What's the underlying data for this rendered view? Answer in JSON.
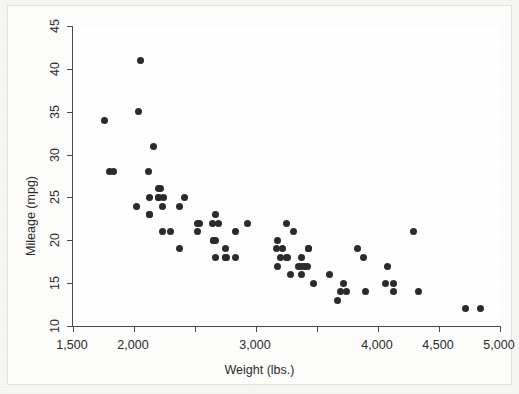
{
  "figure": {
    "background_color": "#f6f6f4",
    "paper_color": "#fdfdfc",
    "axis_color": "#4a4a4a",
    "marker_color": "#2b2b2b"
  },
  "chart_data": {
    "type": "scatter",
    "title": "",
    "xlabel": "Weight (lbs.)",
    "ylabel": "Mileage (mpg)",
    "xlim": [
      1500,
      5000
    ],
    "ylim": [
      10,
      45
    ],
    "xticks": [
      1500,
      2000,
      2500,
      3000,
      3500,
      4000,
      4500,
      5000
    ],
    "xtick_labels": [
      "1,500",
      "2,000",
      "",
      "3,000",
      "",
      "4,000",
      "4,500",
      "5,000"
    ],
    "yticks": [
      10,
      15,
      20,
      25,
      30,
      35,
      40,
      45
    ],
    "ytick_labels": [
      "10",
      "15",
      "20",
      "25",
      "30",
      "35",
      "40",
      "45"
    ],
    "grid": false,
    "legend": false,
    "marker": "filled-circle",
    "marker_size_px": 7,
    "n_points": 74,
    "series": [
      {
        "name": "mpg vs weight",
        "x": [
          2930,
          3350,
          2640,
          3250,
          4080,
          3670,
          2230,
          2130,
          4060,
          3600,
          3740,
          4840,
          3900,
          4330,
          3720,
          3370,
          4130,
          4720,
          3370,
          4130,
          2690,
          3470,
          3880,
          3400,
          3180,
          3220,
          3430,
          3260,
          3830,
          2370,
          2020,
          3280,
          2750,
          3430,
          2120,
          2670,
          2220,
          2130,
          2650,
          3250,
          4290,
          3200,
          2540,
          2300,
          2230,
          2750,
          3170,
          2830,
          2520,
          3310,
          2200,
          2520,
          2240,
          2760,
          3420,
          3690,
          3180,
          3370,
          2830,
          2200,
          2670,
          2160,
          2040,
          1800,
          1760,
          2050,
          2410,
          2200,
          2670,
          2370,
          2130,
          2650,
          1830,
          2750
        ],
        "y": [
          22,
          17,
          22,
          22,
          17,
          13,
          21,
          25,
          15,
          16,
          14,
          12,
          14,
          14,
          15,
          18,
          14,
          12,
          16,
          15,
          22,
          15,
          18,
          17,
          20,
          19,
          19,
          18,
          19,
          19,
          24,
          16,
          19,
          19,
          28,
          18,
          26,
          23,
          20,
          18,
          21,
          18,
          22,
          21,
          24,
          18,
          19,
          18,
          22,
          21,
          25,
          21,
          25,
          18,
          17,
          14,
          17,
          17,
          21,
          26,
          20,
          31,
          35,
          28,
          34,
          41,
          25,
          25,
          23,
          24,
          23,
          20,
          28,
          18
        ]
      }
    ]
  },
  "axes": {
    "x_title": "Weight (lbs.)",
    "y_title": "Mileage (mpg)"
  }
}
